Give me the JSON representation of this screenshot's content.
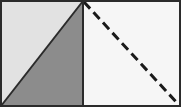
{
  "figure": {
    "width": 181,
    "height": 107,
    "background_color": "#ffffff",
    "border": {
      "color": "#2b2b2b",
      "width": 2,
      "style": "solid"
    },
    "divider": {
      "name": "vertical-divider",
      "x": 83,
      "y_top": 1,
      "y_bottom": 106,
      "color": "#2b2b2b",
      "width": 2,
      "style": "solid"
    },
    "panels": [
      {
        "name": "left-panel",
        "x": 1,
        "y": 1,
        "width": 82,
        "height": 105,
        "regions": [
          {
            "name": "upper-left-triangle",
            "fill": "#e2e2e2",
            "points": "1,1 83,1 1,106"
          },
          {
            "name": "lower-right-triangle",
            "fill": "#8c8c8c",
            "points": "83,1 83,106 1,106"
          }
        ],
        "diagonal": {
          "name": "solid-diagonal",
          "x1": 1,
          "y1": 106,
          "x2": 83,
          "y2": 1,
          "color": "#2b2b2b",
          "width": 2,
          "style": "solid"
        }
      },
      {
        "name": "right-panel",
        "x": 83,
        "y": 1,
        "width": 97,
        "height": 105,
        "regions": [
          {
            "name": "right-panel-background",
            "fill": "#f6f6f6",
            "points": "83,1 180,1 180,106 83,106"
          }
        ],
        "diagonal": {
          "name": "dashed-diagonal",
          "x1": 84,
          "y1": 2,
          "x2": 179,
          "y2": 105,
          "color": "#1a1a1a",
          "width": 3,
          "style": "dashed",
          "dash_length": 9,
          "gap_length": 5
        }
      }
    ]
  }
}
